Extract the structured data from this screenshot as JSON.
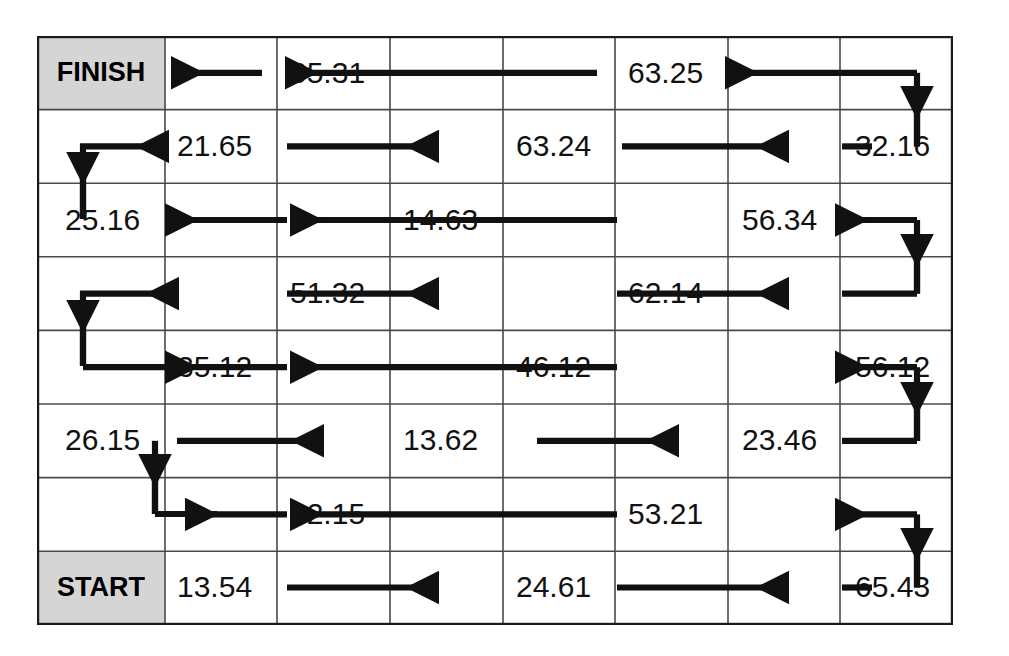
{
  "diagram": {
    "type": "serpentine-flow-grid",
    "title": "",
    "rows": 8,
    "cols": 8,
    "start_label": "START",
    "finish_label": "FINISH",
    "label_cell_fill": "#d5d5d5",
    "grid_line_color": "#4a4a4a",
    "border_color": "#1a1a1a",
    "flow_color": "#111111",
    "background": "#ffffff",
    "flow_rows": [
      {
        "index": 0,
        "name": "row-finish",
        "direction": "left",
        "left_label": "FINISH",
        "values": [
          "65.31",
          "63.25"
        ]
      },
      {
        "index": 1,
        "name": "row-2",
        "direction": "right",
        "left_label": "",
        "values": [
          "21.65",
          "63.24",
          "32.16"
        ]
      },
      {
        "index": 2,
        "name": "row-3",
        "direction": "left",
        "left_label": "",
        "values": [
          "25.16",
          "14.63",
          "56.34"
        ]
      },
      {
        "index": 3,
        "name": "row-4",
        "direction": "right",
        "left_label": "",
        "values": [
          "51.32",
          "62.14"
        ]
      },
      {
        "index": 4,
        "name": "row-5",
        "direction": "left",
        "left_label": "",
        "values": [
          "35.12",
          "46.12",
          "56.12"
        ]
      },
      {
        "index": 5,
        "name": "row-6",
        "direction": "right",
        "left_label": "",
        "values": [
          "26.15",
          "13.62",
          "23.46"
        ]
      },
      {
        "index": 6,
        "name": "row-7",
        "direction": "left",
        "left_label": "",
        "values": [
          "42.15",
          "53.21"
        ]
      },
      {
        "index": 7,
        "name": "row-start",
        "direction": "right",
        "left_label": "START",
        "values": [
          "13.54",
          "24.61",
          "65.43"
        ]
      }
    ],
    "all_values": [
      "65.31",
      "63.25",
      "21.65",
      "63.24",
      "32.16",
      "25.16",
      "14.63",
      "56.34",
      "51.32",
      "62.14",
      "35.12",
      "46.12",
      "56.12",
      "26.15",
      "13.62",
      "23.46",
      "42.15",
      "53.21",
      "13.54",
      "24.61",
      "65.43"
    ],
    "cells": {
      "r0c0": "FINISH",
      "r0c2": "65.31",
      "r0c5": "63.25",
      "r1c1": "21.65",
      "r1c4": "63.24",
      "r1c7": "32.16",
      "r2c0": "25.16",
      "r2c3": "14.63",
      "r2c6": "56.34",
      "r3c2": "51.32",
      "r3c5": "62.14",
      "r4c1": "35.12",
      "r4c4": "46.12",
      "r4c7": "56.12",
      "r5c0": "26.15",
      "r5c3": "13.62",
      "r5c6": "23.46",
      "r6c2": "42.15",
      "r6c5": "53.21",
      "r7c0_label": "START",
      "r7c1": "13.54",
      "r7c4": "24.61",
      "r7c7": "65.43"
    }
  }
}
